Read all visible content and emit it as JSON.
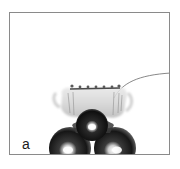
{
  "figure": {
    "panel_label": "a",
    "frame_color": "#8a8a8a",
    "background_color": "#ffffff",
    "subject": {
      "description": "Photograph of a translucent crown-like shell resting on a stack of three dark metallic spheres, with a thin fiber curving off to the right edge",
      "spheres": [
        {
          "name": "top-center-sphere",
          "cx": 82,
          "cy": 112,
          "r": 16
        },
        {
          "name": "bottom-left-sphere",
          "cx": 60,
          "cy": 135,
          "r": 21
        },
        {
          "name": "bottom-right-sphere",
          "cx": 105,
          "cy": 135,
          "r": 21
        }
      ],
      "sphere_color": "#1c1c1c",
      "highlight_color": "#ffffff",
      "shell_color": "#c8c8c8",
      "fiber_color": "#7a7a7a"
    }
  }
}
